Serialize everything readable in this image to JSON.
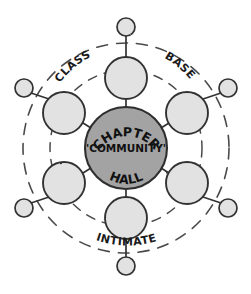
{
  "diagram": {
    "style": "hand-drawn pencil sketch",
    "colors": {
      "background": "#ffffff",
      "core_fill": "#a0a0a0",
      "node_fill": "#e0e0e0",
      "stroke": "#3a3a3a",
      "text": "#1a1a1a"
    },
    "core": {
      "name": "chapter-hall-core",
      "line_top": "CHAPTER",
      "line_middle": "'COMMUNITY'",
      "line_bottom": "HALL",
      "center_x": 126,
      "center_y": 148,
      "radius": 41
    },
    "ring_labels": [
      {
        "id": "class",
        "text": "CLASS",
        "position": "upper-left"
      },
      {
        "id": "base",
        "text": "BASE",
        "position": "upper-right"
      },
      {
        "id": "intimate",
        "text": "INTIMATE",
        "position": "bottom"
      }
    ],
    "medium_nodes": [
      {
        "id": "node-top",
        "angle_deg": 270,
        "cx": 126,
        "cy": 78,
        "r": 21
      },
      {
        "id": "node-upper-right",
        "angle_deg": 330,
        "cx": 187,
        "cy": 113,
        "r": 21
      },
      {
        "id": "node-lower-right",
        "angle_deg": 30,
        "cx": 187,
        "cy": 183,
        "r": 21
      },
      {
        "id": "node-bottom",
        "angle_deg": 90,
        "cx": 126,
        "cy": 218,
        "r": 21
      },
      {
        "id": "node-lower-left",
        "angle_deg": 150,
        "cx": 64,
        "cy": 183,
        "r": 21
      },
      {
        "id": "node-upper-left",
        "angle_deg": 210,
        "cx": 64,
        "cy": 113,
        "r": 21
      }
    ],
    "small_nodes": [
      {
        "id": "outer-top",
        "cx": 126,
        "cy": 27,
        "r": 9
      },
      {
        "id": "outer-upper-right",
        "cx": 228,
        "cy": 88,
        "r": 9
      },
      {
        "id": "outer-lower-right",
        "cx": 228,
        "cy": 208,
        "r": 9
      },
      {
        "id": "outer-bottom",
        "cx": 126,
        "cy": 266,
        "r": 9
      },
      {
        "id": "outer-lower-left",
        "cx": 24,
        "cy": 208,
        "r": 9
      },
      {
        "id": "outer-upper-left",
        "cx": 24,
        "cy": 88,
        "r": 9
      }
    ],
    "dashed_rings": [
      {
        "id": "inner-dashed-ring",
        "rx": 76,
        "ry": 78
      },
      {
        "id": "outer-dashed-ring",
        "rx": 103,
        "ry": 105
      }
    ]
  }
}
